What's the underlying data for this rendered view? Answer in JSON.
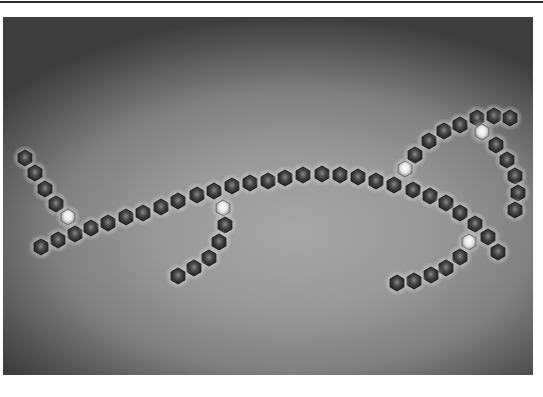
{
  "figure": {
    "frame": {
      "x": 3,
      "y": 17,
      "width": 530,
      "height": 358
    },
    "colors": {
      "background_center": "#9a9a9a",
      "background_edge": "#3e3e3e",
      "particle_dark": "#3a3a3a",
      "particle_rim": "#1e1e1e",
      "particle_bright": "#f2f2f2",
      "halo": "#d8d8d8"
    },
    "particle_radius": 8,
    "particles": [
      {
        "x": 25,
        "y": 158,
        "bright": false
      },
      {
        "x": 35,
        "y": 173,
        "bright": false
      },
      {
        "x": 45,
        "y": 189,
        "bright": false
      },
      {
        "x": 56,
        "y": 204,
        "bright": false
      },
      {
        "x": 68,
        "y": 217,
        "bright": true
      },
      {
        "x": 75,
        "y": 234,
        "bright": false
      },
      {
        "x": 58,
        "y": 240,
        "bright": false
      },
      {
        "x": 41,
        "y": 247,
        "bright": false
      },
      {
        "x": 91,
        "y": 228,
        "bright": false
      },
      {
        "x": 108,
        "y": 223,
        "bright": false
      },
      {
        "x": 126,
        "y": 217,
        "bright": false
      },
      {
        "x": 143,
        "y": 213,
        "bright": false
      },
      {
        "x": 161,
        "y": 207,
        "bright": false
      },
      {
        "x": 178,
        "y": 201,
        "bright": false
      },
      {
        "x": 197,
        "y": 195,
        "bright": false
      },
      {
        "x": 214,
        "y": 191,
        "bright": false
      },
      {
        "x": 232,
        "y": 186,
        "bright": false
      },
      {
        "x": 250,
        "y": 183,
        "bright": false
      },
      {
        "x": 268,
        "y": 181,
        "bright": false
      },
      {
        "x": 285,
        "y": 178,
        "bright": false
      },
      {
        "x": 303,
        "y": 175,
        "bright": false
      },
      {
        "x": 322,
        "y": 174,
        "bright": false
      },
      {
        "x": 340,
        "y": 175,
        "bright": false
      },
      {
        "x": 358,
        "y": 177,
        "bright": false
      },
      {
        "x": 376,
        "y": 181,
        "bright": false
      },
      {
        "x": 394,
        "y": 185,
        "bright": false
      },
      {
        "x": 413,
        "y": 190,
        "bright": false
      },
      {
        "x": 430,
        "y": 196,
        "bright": false
      },
      {
        "x": 446,
        "y": 203,
        "bright": false
      },
      {
        "x": 460,
        "y": 213,
        "bright": false
      },
      {
        "x": 475,
        "y": 224,
        "bright": false
      },
      {
        "x": 488,
        "y": 237,
        "bright": false
      },
      {
        "x": 498,
        "y": 252,
        "bright": false
      },
      {
        "x": 223,
        "y": 208,
        "bright": true
      },
      {
        "x": 225,
        "y": 225,
        "bright": false
      },
      {
        "x": 219,
        "y": 242,
        "bright": false
      },
      {
        "x": 209,
        "y": 258,
        "bright": false
      },
      {
        "x": 194,
        "y": 268,
        "bright": false
      },
      {
        "x": 178,
        "y": 276,
        "bright": false
      },
      {
        "x": 405,
        "y": 169,
        "bright": true
      },
      {
        "x": 415,
        "y": 155,
        "bright": false
      },
      {
        "x": 429,
        "y": 141,
        "bright": false
      },
      {
        "x": 444,
        "y": 131,
        "bright": false
      },
      {
        "x": 460,
        "y": 125,
        "bright": false
      },
      {
        "x": 477,
        "y": 118,
        "bright": false
      },
      {
        "x": 494,
        "y": 116,
        "bright": false
      },
      {
        "x": 510,
        "y": 118,
        "bright": false
      },
      {
        "x": 482,
        "y": 132,
        "bright": true
      },
      {
        "x": 496,
        "y": 145,
        "bright": false
      },
      {
        "x": 507,
        "y": 160,
        "bright": false
      },
      {
        "x": 515,
        "y": 176,
        "bright": false
      },
      {
        "x": 518,
        "y": 193,
        "bright": false
      },
      {
        "x": 515,
        "y": 210,
        "bright": false
      },
      {
        "x": 469,
        "y": 242,
        "bright": true
      },
      {
        "x": 460,
        "y": 257,
        "bright": false
      },
      {
        "x": 446,
        "y": 268,
        "bright": false
      },
      {
        "x": 431,
        "y": 275,
        "bright": false
      },
      {
        "x": 414,
        "y": 281,
        "bright": false
      },
      {
        "x": 397,
        "y": 283,
        "bright": false
      }
    ]
  }
}
